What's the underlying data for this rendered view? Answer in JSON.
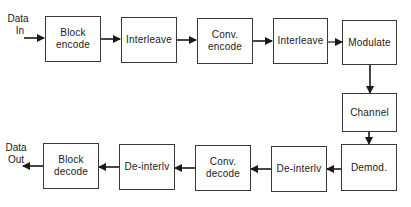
{
  "diagram": {
    "type": "block-diagram",
    "title": "",
    "terminals": {
      "input": {
        "label_line1": "Data",
        "label_line2": "In"
      },
      "output": {
        "label_line1": "Data",
        "label_line2": "Out"
      }
    },
    "blocks": {
      "block_encode": {
        "line1": "Block",
        "line2": "encode"
      },
      "interleave_1": {
        "line1": "Interleave"
      },
      "conv_encode": {
        "line1": "Conv.",
        "line2": "encode"
      },
      "interleave_2": {
        "line1": "Interleave"
      },
      "modulate": {
        "line1": "Modulate"
      },
      "channel": {
        "line1": "Channel"
      },
      "demod": {
        "line1": "Demod."
      },
      "deinterlv_1": {
        "line1": "De-interlv"
      },
      "conv_decode": {
        "line1": "Conv.",
        "line2": "decode"
      },
      "deinterlv_2": {
        "line1": "De-interlv"
      },
      "block_decode": {
        "line1": "Block",
        "line2": "decode"
      }
    },
    "flow": [
      "Data In",
      "Block encode",
      "Interleave",
      "Conv. encode",
      "Interleave",
      "Modulate",
      "Channel",
      "Demod.",
      "De-interlv",
      "Conv. decode",
      "De-interlv",
      "Block decode",
      "Data Out"
    ],
    "colors": {
      "stroke": "#2a2a2a",
      "background": "#ffffff"
    }
  }
}
